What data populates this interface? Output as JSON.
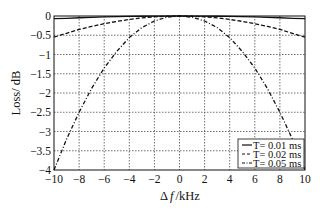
{
  "chart_data": {
    "type": "line",
    "title": "",
    "xlabel": "Δ f / kHz",
    "ylabel": "Loss/ dB",
    "xlim": [
      -10,
      10
    ],
    "ylim": [
      -4,
      0
    ],
    "grid": true,
    "legend_position": "lower right",
    "x_ticks": [
      "-10",
      "-8",
      "-6",
      "-4",
      "-2",
      "0",
      "2",
      "4",
      "6",
      "8",
      "10"
    ],
    "y_ticks": [
      "0",
      "-0.5",
      "-1",
      "-1.5",
      "-2",
      "-2.5",
      "-3",
      "-3.5",
      "-4"
    ],
    "x": [
      -10,
      -9,
      -8,
      -7,
      -6,
      -5,
      -4,
      -3,
      -2,
      -1,
      0,
      1,
      2,
      3,
      4,
      5,
      6,
      7,
      8,
      9,
      10
    ],
    "series": [
      {
        "name": "T= 0.01 ms",
        "style": "solid",
        "values": [
          -0.07,
          -0.06,
          -0.045,
          -0.035,
          -0.025,
          -0.017,
          -0.011,
          -0.006,
          -0.003,
          -0.001,
          0,
          -0.001,
          -0.003,
          -0.006,
          -0.011,
          -0.017,
          -0.025,
          -0.035,
          -0.045,
          -0.06,
          -0.07
        ]
      },
      {
        "name": "T= 0.02 ms",
        "style": "dashed",
        "values": [
          -0.55,
          -0.45,
          -0.35,
          -0.27,
          -0.2,
          -0.14,
          -0.09,
          -0.05,
          -0.022,
          -0.006,
          0,
          -0.006,
          -0.022,
          -0.05,
          -0.09,
          -0.14,
          -0.2,
          -0.27,
          -0.35,
          -0.45,
          -0.55
        ]
      },
      {
        "name": "T= 0.05 ms",
        "style": "dashdot",
        "values": [
          -4.0,
          -3.2,
          -2.5,
          -1.88,
          -1.35,
          -0.92,
          -0.56,
          -0.3,
          -0.13,
          -0.03,
          0,
          -0.03,
          -0.13,
          -0.3,
          -0.56,
          -0.92,
          -1.35,
          -1.88,
          -2.5,
          -3.2,
          -4.0
        ]
      }
    ]
  },
  "legend": {
    "items": [
      {
        "label": "T= 0.01 ms"
      },
      {
        "label": "T= 0.02 ms"
      },
      {
        "label": "T= 0.05 ms"
      }
    ]
  },
  "axes": {
    "xlabel_delta": "Δ",
    "xlabel_f": "f",
    "xlabel_unit": "/kHz",
    "ylabel": "Loss/ dB"
  }
}
